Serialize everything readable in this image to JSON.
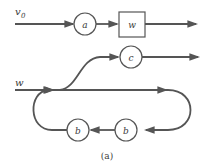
{
  "diagram": {
    "caption": "(a)",
    "colors": {
      "stroke": "#555555",
      "text": "#3a3a3a",
      "background": "#ffffff"
    },
    "inputs": [
      {
        "id": "v0",
        "label": "v",
        "subscript": "0"
      },
      {
        "id": "w",
        "label": "w"
      }
    ],
    "nodes": [
      {
        "id": "a",
        "label": "a",
        "shape": "circle"
      },
      {
        "id": "W",
        "label": "w",
        "shape": "box"
      },
      {
        "id": "c",
        "label": "c",
        "shape": "circle"
      },
      {
        "id": "b1",
        "label": "b",
        "shape": "circle"
      },
      {
        "id": "b2",
        "label": "b",
        "shape": "circle"
      }
    ],
    "edges": [
      {
        "from": "v0",
        "to": "a"
      },
      {
        "from": "a",
        "to": "W"
      },
      {
        "from": "W",
        "to": "output-1"
      },
      {
        "from": "w",
        "to": "loop"
      },
      {
        "from": "loop",
        "to": "c"
      },
      {
        "from": "c",
        "to": "output-2"
      },
      {
        "from": "loop",
        "to": "b2"
      },
      {
        "from": "b2",
        "to": "b1"
      },
      {
        "from": "b1",
        "to": "loop"
      }
    ]
  }
}
